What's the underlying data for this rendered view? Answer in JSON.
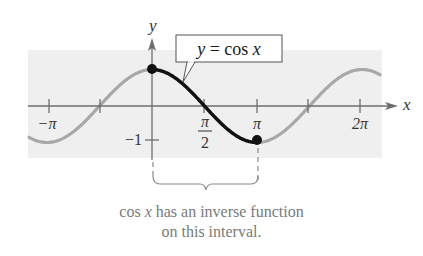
{
  "diagram": {
    "function_label": "y = cos x",
    "axis_labels": {
      "x": "x",
      "y": "y"
    },
    "x_ticks": [
      {
        "label": "−π",
        "value": "-pi"
      },
      {
        "label": "π",
        "value": "pi/2",
        "fraction": {
          "num": "π",
          "den": "2"
        }
      },
      {
        "label": "π",
        "value": "pi"
      },
      {
        "label": "2π",
        "value": "2pi"
      }
    ],
    "y_ticks": [
      {
        "label": "−1",
        "value": -1
      }
    ],
    "highlighted_interval": {
      "from": "0",
      "to": "π",
      "endpoints": [
        "(0, 1)",
        "(π, −1)"
      ]
    },
    "caption_line1_prefix": "cos ",
    "caption_line1_var": "x",
    "caption_line1_suffix": " has an inverse function",
    "caption_line2": "on this interval.",
    "colors": {
      "band": "#efefef",
      "curve_faded": "#a8a8a8",
      "curve_highlight": "#111111",
      "axis": "#6e6e6e",
      "caption": "#7a7a7a"
    }
  },
  "chart_data": {
    "type": "line",
    "title": "y = cos x",
    "xlabel": "x",
    "ylabel": "y",
    "x_tick_labels": [
      "−π",
      "π/2",
      "π",
      "2π"
    ],
    "y_tick_labels": [
      "−1"
    ],
    "xlim": [
      -3.96,
      7.35
    ],
    "ylim": [
      -1,
      1
    ],
    "series": [
      {
        "name": "cos x (full)",
        "style": "gray",
        "x_range": [
          -3.96,
          7.35
        ]
      },
      {
        "name": "cos x on [0, π]",
        "style": "black bold",
        "x_range": [
          0,
          3.1416
        ],
        "points": [
          [
            0,
            1
          ],
          [
            1.5708,
            0
          ],
          [
            3.1416,
            -1
          ]
        ]
      }
    ],
    "annotations": [
      "cos x has an inverse function on this interval."
    ]
  }
}
